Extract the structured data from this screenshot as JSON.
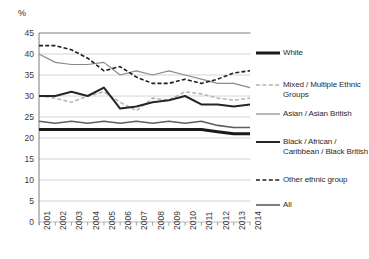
{
  "chart_data": {
    "type": "line",
    "title": "",
    "xlabel": "",
    "ylabel": "%",
    "ylim": [
      0,
      45
    ],
    "ytick_step": 5,
    "yticks": [
      "0",
      "5",
      "10",
      "15",
      "20",
      "25",
      "30",
      "35",
      "40",
      "45"
    ],
    "grid": true,
    "legend_position": "right",
    "categories": [
      "2001",
      "2002",
      "2003",
      "2004",
      "2005",
      "2006",
      "2007",
      "2008",
      "2009",
      "2010",
      "2011",
      "2012",
      "2013",
      "2014"
    ],
    "series": [
      {
        "name": "White",
        "style": "solid",
        "width": 3.0,
        "color": "#1a1a1a",
        "values": [
          22.0,
          22.0,
          22.0,
          22.0,
          22.0,
          22.0,
          22.0,
          22.0,
          22.0,
          22.0,
          22.0,
          21.5,
          21.0,
          21.0
        ]
      },
      {
        "name": "Mixed / Multiple Ethnic Groups",
        "style": "dashed",
        "width": 1.6,
        "color": "#b5b5b5",
        "values": [
          30.0,
          29.5,
          28.5,
          30.0,
          31.0,
          28.5,
          26.5,
          29.5,
          29.0,
          31.0,
          30.5,
          29.5,
          29.0,
          29.5
        ]
      },
      {
        "name": "Asian / Asian British",
        "style": "solid",
        "width": 1.2,
        "color": "#8a8a8a",
        "values": [
          40.0,
          38.0,
          37.5,
          37.5,
          38.0,
          35.0,
          36.0,
          35.0,
          36.0,
          35.0,
          34.0,
          33.0,
          33.0,
          32.0
        ]
      },
      {
        "name": "Black / African / Caribbean / Black British",
        "style": "solid",
        "width": 2.0,
        "color": "#262626",
        "values": [
          30.0,
          30.0,
          31.0,
          30.0,
          32.0,
          27.0,
          27.5,
          28.5,
          29.0,
          30.0,
          28.0,
          28.0,
          27.5,
          28.0
        ]
      },
      {
        "name": "Other ethnic group",
        "style": "dashed",
        "width": 1.6,
        "color": "#1f1f1f",
        "values": [
          42.0,
          42.0,
          41.0,
          39.0,
          36.0,
          37.0,
          34.5,
          33.0,
          33.0,
          34.0,
          33.0,
          34.0,
          35.5,
          36.0
        ]
      },
      {
        "name": "All",
        "style": "solid",
        "width": 1.6,
        "color": "#5e5e5e",
        "values": [
          24.0,
          23.5,
          24.0,
          23.5,
          24.0,
          23.5,
          24.0,
          23.5,
          24.0,
          23.5,
          24.0,
          23.0,
          22.5,
          22.5
        ]
      }
    ]
  },
  "legend": {
    "items": [
      {
        "label": "White",
        "key": "white"
      },
      {
        "label": "Mixed / Multiple Ethnic Groups",
        "key": "mixed"
      },
      {
        "label": "Asian / Asian British",
        "key": "asian"
      },
      {
        "label": "Black / African / Caribbean / Black British",
        "key": "black"
      },
      {
        "label": "Other ethnic group",
        "key": "other"
      },
      {
        "label": "All",
        "key": "all"
      }
    ]
  },
  "axis": {
    "unit_label": "%"
  },
  "header": {
    "cropped_title": ""
  }
}
